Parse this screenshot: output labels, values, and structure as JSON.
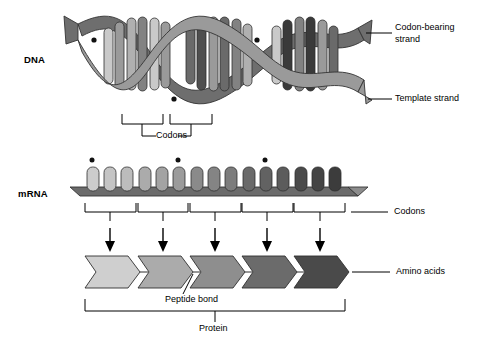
{
  "diagram": {
    "labels": {
      "dna": "DNA",
      "mrna": "mRNA",
      "codon_bearing_strand_line1": "Codon-bearing",
      "codon_bearing_strand_line2": "strand",
      "template_strand": "Template strand",
      "dna_codons": "Codons",
      "mrna_codons": "Codons",
      "amino_acids": "Amino acids",
      "peptide_bond": "Peptide bond",
      "protein": "Protein"
    }
  },
  "colors": {
    "ink": "#000000",
    "background": "#ffffff",
    "helix_front_ribbon": "#9a9a9a",
    "helix_back_ribbon": "#6e6e6e",
    "helix_ribbon_edge": "#3a3a3a",
    "mrna_backbone": "#6b6b6b",
    "mrna_backbone_edge": "#3a3a3a"
  },
  "dna": {
    "turns": 3,
    "strand_count": 2,
    "base_pair_rungs": 18,
    "rung_shades": [
      "#c9c9c9",
      "#b0b0b0",
      "#9a9a9a",
      "#828282",
      "#6a6a6a",
      "#4f4f4f",
      "#3a3a3a"
    ],
    "marker_dot_count": 3,
    "codon_brackets": 2
  },
  "mrna": {
    "base_count": 15,
    "codon_count": 5,
    "marker_dot_count": 3,
    "base_shades": [
      "#cccccc",
      "#c4c4c4",
      "#bcbcbc",
      "#ababab",
      "#a3a3a3",
      "#9b9b9b",
      "#8a8a8a",
      "#848484",
      "#7c7c7c",
      "#6a6a6a",
      "#626262",
      "#5c5c5c",
      "#4a4a4a",
      "#444444",
      "#3c3c3c"
    ]
  },
  "translation": {
    "arrow_count": 5
  },
  "protein": {
    "amino_acid_count": 5,
    "amino_acid_shades": [
      "#cfcfcf",
      "#ababab",
      "#8e8e8e",
      "#6b6b6b",
      "#4a4a4a"
    ]
  }
}
